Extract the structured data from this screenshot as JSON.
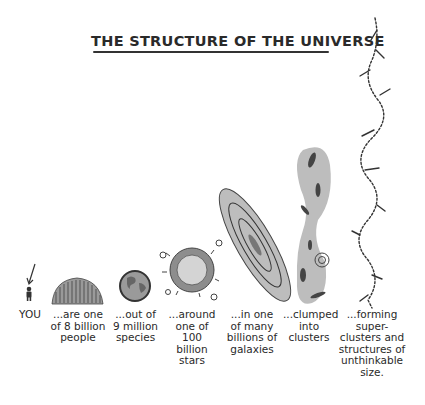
{
  "title": "THE STRUCTURE OF THE UNIVERSE",
  "stages": [
    {
      "id": "you",
      "icon": "person-icon",
      "label": "YOU"
    },
    {
      "id": "people",
      "icon": "crowd-icon",
      "label": "...are one\nof 8 billion\npeople"
    },
    {
      "id": "species",
      "icon": "earth-icon",
      "label": "...out of\n9 million\nspecies"
    },
    {
      "id": "stars",
      "icon": "sun-icon",
      "label": "...around\none of\n100\nbillion\nstars"
    },
    {
      "id": "galaxies",
      "icon": "galaxy-icon",
      "label": "...in one\nof many\nbillions of\ngalaxies"
    },
    {
      "id": "clusters",
      "icon": "galaxy-cluster-icon",
      "label": "...clumped\ninto\nclusters"
    },
    {
      "id": "superclusters",
      "icon": "supercluster-filament-icon",
      "label": "...forming\nsuper-\nclusters and\nstructures of\nunthinkable\nsize."
    }
  ],
  "colors": {
    "ink": "#2a2a2a",
    "fill": "#b8b8b8",
    "background": "#ffffff"
  }
}
